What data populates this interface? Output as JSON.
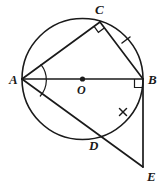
{
  "figure": {
    "name": "circle-geometry-diagram",
    "type": "euclidean-geometry-diagram",
    "background_color": "#ffffff",
    "stroke_color": "#1a1a1a",
    "width": 163,
    "height": 185
  },
  "circle": {
    "name": "main-circle",
    "center_label": "O",
    "center_x": 82.5,
    "center_y": 79,
    "radius": 60.5
  },
  "points": {
    "A": {
      "label": "A",
      "x": 22,
      "y": 79,
      "label_x": 9,
      "label_y": 84
    },
    "B": {
      "label": "B",
      "x": 143,
      "y": 79,
      "label_x": 148,
      "label_y": 84
    },
    "C": {
      "label": "C",
      "x": 100,
      "y": 22,
      "label_x": 95,
      "label_y": 14
    },
    "D": {
      "label": "D",
      "x": 95,
      "y": 133,
      "label_x": 91,
      "label_y": 149
    },
    "E": {
      "label": "E",
      "x": 143,
      "y": 167,
      "label_x": 148,
      "label_y": 180
    },
    "O": {
      "label": "O",
      "x": 82.5,
      "y": 79,
      "label_x": 78,
      "label_y": 93
    }
  },
  "segments": [
    {
      "name": "segment-AB-diameter",
      "from": "A",
      "to": "B"
    },
    {
      "name": "segment-AC",
      "from": "A",
      "to": "C"
    },
    {
      "name": "segment-CB",
      "from": "C",
      "to": "B"
    },
    {
      "name": "segment-AE",
      "from": "A",
      "to": "E"
    },
    {
      "name": "segment-BE",
      "from": "B",
      "to": "E"
    }
  ],
  "marks": {
    "right_angle_at_C": {
      "name": "right-angle-mark-C",
      "vertex": "C",
      "description": "right angle between CA and CB inscribed in semicircle"
    },
    "right_angle_at_B": {
      "name": "right-angle-mark-B",
      "vertex": "B",
      "description": "right angle between AB and BE, BE tangent to circle"
    },
    "angle_arc_at_A": {
      "name": "angle-bisector-arc-A",
      "vertex": "A",
      "description": "arc marking angle CAD bisected by AB"
    },
    "tick_upper": {
      "name": "congruence-tick-upper",
      "on_segment": "CB",
      "x": 126,
      "y": 40,
      "count": 1
    },
    "tick_lower": {
      "name": "congruence-tick-lower",
      "on_segment": "arc-DB",
      "x": 123,
      "y": 112,
      "count": 1
    }
  },
  "labels": {
    "A": "A",
    "B": "B",
    "C": "C",
    "D": "D",
    "E": "E",
    "O": "O"
  }
}
